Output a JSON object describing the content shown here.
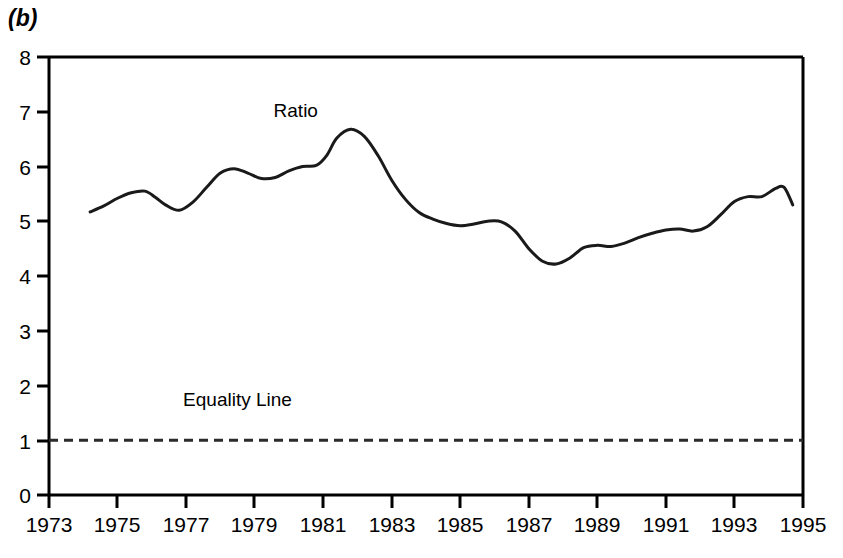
{
  "panel": {
    "label": "(b)"
  },
  "chart_data": {
    "type": "line",
    "title": "",
    "subtitle": "",
    "xlabel": "",
    "ylabel": "",
    "xlim": [
      1973,
      1995
    ],
    "ylim": [
      0,
      8
    ],
    "grid": false,
    "legend_position": "inline-annotation",
    "xticks": [
      "1973",
      "1975",
      "1977",
      "1979",
      "1981",
      "1983",
      "1985",
      "1987",
      "1989",
      "1991",
      "1993",
      "1995"
    ],
    "xtick_values": [
      1973,
      1975,
      1977,
      1979,
      1981,
      1983,
      1985,
      1987,
      1989,
      1991,
      1993,
      1995
    ],
    "yticks": [
      "0",
      "1",
      "2",
      "3",
      "4",
      "5",
      "6",
      "7",
      "8"
    ],
    "ytick_values": [
      0,
      1,
      2,
      3,
      4,
      5,
      6,
      7,
      8
    ],
    "annotations": [
      {
        "text": "Ratio",
        "x": 1980.2,
        "y": 6.9
      },
      {
        "text": "Equality Line",
        "x": 1978.5,
        "y": 1.62
      }
    ],
    "series": [
      {
        "name": "Ratio",
        "style": "solid",
        "color": "#1a1a1a",
        "x": [
          1974.2,
          1974.6,
          1975.0,
          1975.4,
          1975.8,
          1976.1,
          1976.4,
          1976.8,
          1977.2,
          1977.6,
          1978.0,
          1978.4,
          1978.8,
          1979.2,
          1979.6,
          1980.0,
          1980.4,
          1980.8,
          1981.1,
          1981.4,
          1981.8,
          1982.2,
          1982.6,
          1983.0,
          1983.4,
          1983.8,
          1984.2,
          1984.6,
          1985.0,
          1985.4,
          1985.8,
          1986.2,
          1986.6,
          1987.0,
          1987.4,
          1987.8,
          1988.2,
          1988.6,
          1989.0,
          1989.4,
          1989.8,
          1990.2,
          1990.6,
          1991.0,
          1991.4,
          1991.8,
          1992.2,
          1992.6,
          1993.0,
          1993.4,
          1993.8,
          1994.2
        ],
        "y": [
          5.17,
          5.28,
          5.42,
          5.52,
          5.55,
          5.44,
          5.3,
          5.2,
          5.35,
          5.62,
          5.88,
          5.96,
          5.88,
          5.78,
          5.8,
          5.92,
          6.0,
          6.02,
          6.2,
          6.52,
          6.68,
          6.55,
          6.2,
          5.75,
          5.4,
          5.16,
          5.04,
          4.96,
          4.92,
          4.95,
          5.0,
          4.99,
          4.82,
          4.5,
          4.27,
          4.22,
          4.33,
          4.52,
          4.56,
          4.54,
          4.6,
          4.7,
          4.78,
          4.84,
          4.86,
          4.82,
          4.9,
          5.12,
          5.36,
          5.45,
          5.45,
          5.6
        ]
      },
      {
        "name": "Equality Line",
        "style": "dashed",
        "color": "#2b2b2b",
        "x": [
          1973,
          1995
        ],
        "y": [
          1.0,
          1.0
        ]
      }
    ],
    "series_tail": {
      "name": "Ratio",
      "x": [
        1994.2,
        1994.45,
        1994.7
      ],
      "y": [
        5.6,
        5.62,
        5.3
      ]
    }
  }
}
